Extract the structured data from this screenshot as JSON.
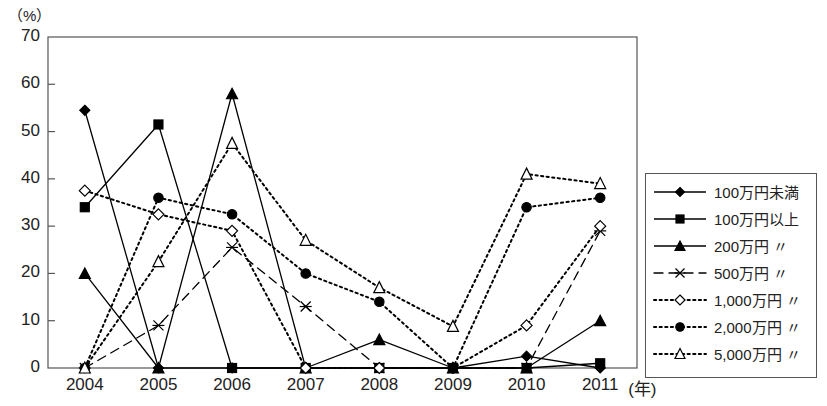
{
  "chart_data": {
    "type": "line",
    "title": "",
    "xlabel": "年",
    "ylabel": "(%)",
    "unit_label": "（%）",
    "x_axis_unit": "(年)",
    "categories": [
      "2004",
      "2005",
      "2006",
      "2007",
      "2008",
      "2009",
      "2010",
      "2011"
    ],
    "ylim": [
      0,
      70
    ],
    "ytick_labels": [
      "0",
      "10",
      "20",
      "30",
      "40",
      "50",
      "60",
      "70"
    ],
    "yticks": [
      0,
      10,
      20,
      30,
      40,
      50,
      60,
      70
    ],
    "grid": false,
    "legend_position": "right-outside",
    "series": [
      {
        "name": "100万円未満",
        "marker": "filled-diamond",
        "line_style": "solid",
        "values": [
          54.5,
          0,
          0,
          0,
          0,
          0,
          2.5,
          0
        ]
      },
      {
        "name": "100万円以上",
        "marker": "filled-square",
        "line_style": "solid",
        "values": [
          34,
          51.5,
          0,
          0,
          0,
          0,
          0,
          1
        ]
      },
      {
        "name": "200万円 〃",
        "marker": "filled-triangle",
        "line_style": "solid",
        "values": [
          20,
          0,
          58,
          0,
          6,
          0,
          0,
          10
        ]
      },
      {
        "name": "500万円 〃",
        "marker": "cross",
        "line_style": "dashed",
        "values": [
          0,
          9,
          25.5,
          13,
          0,
          0,
          0,
          29
        ]
      },
      {
        "name": "1,000万円 〃",
        "marker": "open-diamond",
        "line_style": "dotted",
        "values": [
          37.5,
          32.5,
          29,
          0,
          0,
          0,
          9,
          30
        ]
      },
      {
        "name": "2,000万円 〃",
        "marker": "filled-circle",
        "line_style": "dotted",
        "values": [
          0,
          36,
          32.5,
          20,
          14,
          0,
          34,
          36
        ]
      },
      {
        "name": "5,000万円 〃",
        "marker": "open-triangle",
        "line_style": "dotted",
        "values": [
          0,
          22.5,
          47.5,
          27,
          17,
          8.8,
          41,
          39
        ]
      }
    ]
  },
  "legend": {
    "items": [
      {
        "label": "100万円未満"
      },
      {
        "label": "100万円以上"
      },
      {
        "label": "200万円 〃"
      },
      {
        "label": "500万円 〃"
      },
      {
        "label": "1,000万円 〃"
      },
      {
        "label": "2,000万円 〃"
      },
      {
        "label": "5,000万円 〃"
      }
    ]
  },
  "colors": {
    "line": "#000000",
    "axis": "#555555",
    "text": "#222222",
    "background": "#ffffff"
  }
}
